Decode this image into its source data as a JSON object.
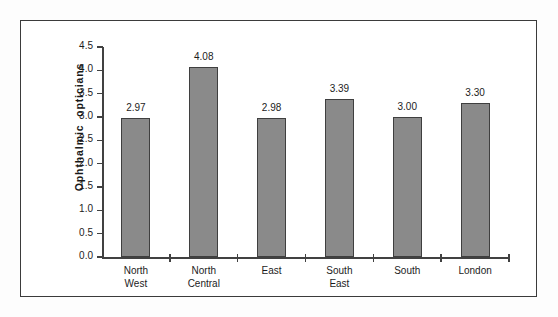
{
  "chart_data": {
    "type": "bar",
    "title": "",
    "subtitle": "",
    "xlabel": "",
    "ylabel": "Ophthalmic  opticians",
    "categories": [
      "North\nWest",
      "North\nCentral",
      "East",
      "South\nEast",
      "South",
      "London"
    ],
    "values": [
      2.97,
      4.08,
      2.98,
      3.39,
      3.0,
      3.3
    ],
    "value_labels": [
      "2.97",
      "4.08",
      "2.98",
      "3.39",
      "3.00",
      "3.30"
    ],
    "ylim": [
      0.0,
      4.5
    ],
    "ytick_labels": [
      "4.5",
      "4.0",
      "3.5",
      "3.0",
      "2.5",
      "2.0",
      "1.5",
      "1.0",
      "0.5",
      "0.0"
    ],
    "ytick_values": [
      4.5,
      4.0,
      3.5,
      3.0,
      2.5,
      2.0,
      1.5,
      1.0,
      0.5,
      0.0
    ],
    "grid": false,
    "legend": null,
    "legend_position": "none",
    "bar_color": "#8a8a8a",
    "bar_edge_color": "#3f3f3f",
    "axis_color": "#414141",
    "background_color": "#ffffff",
    "frame_color": "#3b3b3b"
  }
}
